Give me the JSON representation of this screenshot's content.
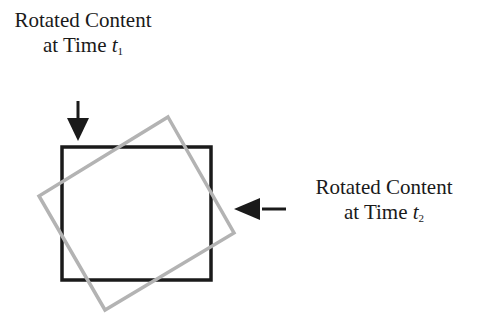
{
  "diagram": {
    "label_t1": {
      "line1": "Rotated Content",
      "line2_prefix": "at Time ",
      "var": "t",
      "sub": "1"
    },
    "label_t2": {
      "line1": "Rotated Content",
      "line2_prefix": "at Time ",
      "var": "t",
      "sub": "2"
    },
    "colors": {
      "original_square": "#1a1a1a",
      "rotated_square": "#b3b3b3",
      "arrows": "#1a1a1a"
    }
  }
}
